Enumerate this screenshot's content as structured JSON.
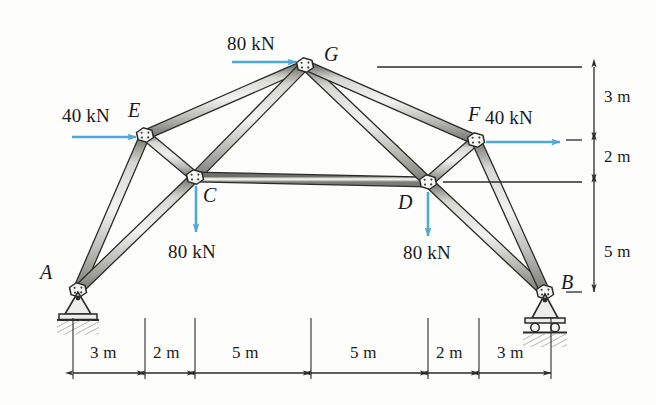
{
  "figure": {
    "type": "truss-free-body-diagram",
    "colors": {
      "member_fill": "#c9c9c4",
      "member_stroke": "#2b2b28",
      "force_arrow": "#4fa9d8",
      "dimension_line": "#2b2b28",
      "ground_hatch": "#8d8d88",
      "text": "#1a1a18"
    }
  },
  "nodes": [
    {
      "id": "A",
      "label": "A",
      "x": 78,
      "y": 290,
      "support": "pin",
      "label_x": 40,
      "label_y": 262
    },
    {
      "id": "B",
      "label": "B",
      "x": 545,
      "y": 292,
      "support": "roller",
      "label_x": 561,
      "label_y": 272
    },
    {
      "id": "C",
      "label": "C",
      "x": 195,
      "y": 177,
      "support": "none",
      "label_x": 203,
      "label_y": 185
    },
    {
      "id": "D",
      "label": "D",
      "x": 428,
      "y": 182,
      "support": "none",
      "label_x": 398,
      "label_y": 192
    },
    {
      "id": "E",
      "label": "E",
      "x": 145,
      "y": 135,
      "support": "none",
      "label_x": 128,
      "label_y": 100
    },
    {
      "id": "F",
      "label": "F",
      "x": 476,
      "y": 140,
      "support": "none",
      "label_x": 468,
      "label_y": 104
    },
    {
      "id": "G",
      "label": "G",
      "x": 305,
      "y": 65,
      "support": "none",
      "label_x": 324,
      "label_y": 44
    }
  ],
  "members": [
    {
      "from": "A",
      "to": "E"
    },
    {
      "from": "A",
      "to": "C"
    },
    {
      "from": "E",
      "to": "C"
    },
    {
      "from": "E",
      "to": "G"
    },
    {
      "from": "C",
      "to": "G"
    },
    {
      "from": "C",
      "to": "D"
    },
    {
      "from": "G",
      "to": "D"
    },
    {
      "from": "G",
      "to": "F"
    },
    {
      "from": "D",
      "to": "F"
    },
    {
      "from": "D",
      "to": "B"
    },
    {
      "from": "F",
      "to": "B"
    }
  ],
  "forces": [
    {
      "id": "load-G",
      "at": "G",
      "magnitude": "80 kN",
      "direction": "right",
      "arrow": {
        "x1": 232,
        "y1": 62,
        "x2": 296,
        "y2": 62
      },
      "label_x": 227,
      "label_y": 34
    },
    {
      "id": "load-E",
      "at": "E",
      "magnitude": "40 kN",
      "direction": "right",
      "arrow": {
        "x1": 72,
        "y1": 137,
        "x2": 136,
        "y2": 137
      },
      "label_x": 62,
      "label_y": 106
    },
    {
      "id": "load-F",
      "at": "F",
      "magnitude": "40 kN",
      "direction": "right",
      "arrow": {
        "x1": 486,
        "y1": 142,
        "x2": 560,
        "y2": 142
      },
      "label_x": 485,
      "label_y": 108
    },
    {
      "id": "load-C",
      "at": "C",
      "magnitude": "80 kN",
      "direction": "down",
      "arrow": {
        "x1": 196,
        "y1": 186,
        "x2": 196,
        "y2": 232
      },
      "label_x": 168,
      "label_y": 242
    },
    {
      "id": "load-D",
      "at": "D",
      "magnitude": "80 kN",
      "direction": "down",
      "arrow": {
        "x1": 428,
        "y1": 192,
        "x2": 428,
        "y2": 236
      },
      "label_x": 403,
      "label_y": 243
    }
  ],
  "dimensions": {
    "horizontal": {
      "baseline_y": 373,
      "segments": [
        {
          "label": "3 m",
          "x1": 73,
          "x2": 145,
          "label_x": 90,
          "label_y": 344
        },
        {
          "label": "2 m",
          "x1": 145,
          "x2": 195,
          "label_x": 153,
          "label_y": 344
        },
        {
          "label": "5 m",
          "x1": 195,
          "x2": 311,
          "label_x": 232,
          "label_y": 344
        },
        {
          "label": "5 m",
          "x1": 311,
          "x2": 428,
          "label_x": 350,
          "label_y": 344
        },
        {
          "label": "2 m",
          "x1": 428,
          "x2": 479,
          "label_x": 436,
          "label_y": 344
        },
        {
          "label": "3 m",
          "x1": 479,
          "x2": 551,
          "label_x": 497,
          "label_y": 344
        }
      ],
      "extension_top_y": 318
    },
    "vertical": {
      "baseline_x": 594,
      "segments": [
        {
          "label": "3 m",
          "y1": 67,
          "y2": 140,
          "label_x": 604,
          "label_y": 88
        },
        {
          "label": "2 m",
          "y1": 140,
          "y2": 182,
          "label_x": 604,
          "label_y": 148
        },
        {
          "label": "5 m",
          "y1": 182,
          "y2": 292,
          "label_x": 604,
          "label_y": 243
        }
      ],
      "reference_lines": [
        {
          "y": 67,
          "x1": 377,
          "x2": 582
        },
        {
          "y": 140,
          "x1": 566,
          "x2": 582
        },
        {
          "y": 182,
          "x1": 443,
          "x2": 582
        },
        {
          "y": 292,
          "x1": 566,
          "x2": 582
        }
      ]
    }
  }
}
